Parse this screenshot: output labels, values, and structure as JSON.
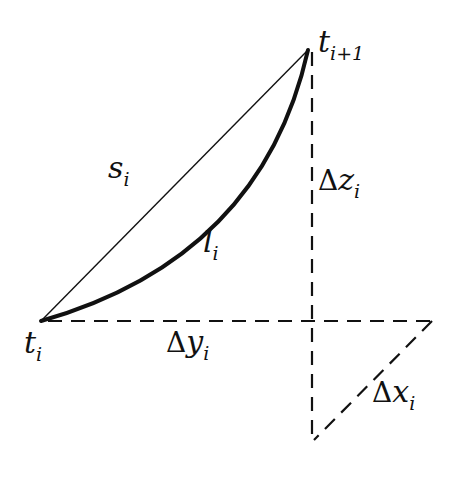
{
  "diagram": {
    "colors": {
      "ink": "#111111",
      "background": "#ffffff"
    },
    "points": {
      "t_i": {
        "label": "t",
        "subscript": "i"
      },
      "t_i_plus_1": {
        "label": "t",
        "subscript": "i+1"
      }
    },
    "edges": {
      "chord": {
        "label": "s",
        "subscript": "i",
        "style": "thin solid"
      },
      "arc": {
        "label": "l",
        "subscript": "i",
        "style": "thick solid curve"
      },
      "delta_z": {
        "symbol": "Δ",
        "label": "z",
        "subscript": "i",
        "style": "dashed vertical"
      },
      "delta_y": {
        "symbol": "Δ",
        "label": "y",
        "subscript": "i",
        "style": "dashed horizontal"
      },
      "delta_x": {
        "symbol": "Δ",
        "label": "x",
        "subscript": "i",
        "style": "dashed diagonal"
      }
    }
  }
}
